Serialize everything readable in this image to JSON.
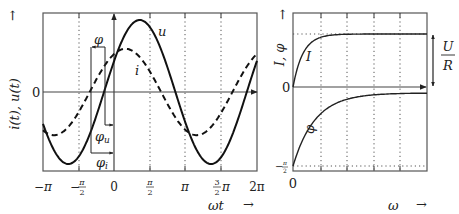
{
  "left_panel": {
    "y_label": "i(t), u(t)",
    "y_arrow": "↑",
    "zero_label": "0",
    "x_label": "ωt",
    "x_arrow": "→",
    "x_ticks": [
      "−π",
      "−π/2",
      "0",
      "π/2",
      "π",
      "3/2π",
      "2π"
    ],
    "curve_labels": {
      "u": "u",
      "i": "i"
    },
    "phase_labels": {
      "phi": "φ",
      "phi_u": "φu",
      "phi_i": "φi"
    }
  },
  "right_panel": {
    "y_label": "I, φ",
    "y_arrow": "↑",
    "zero_label": "0",
    "neg_label": "−π/2",
    "x_zero_label": "0",
    "x_label": "ω",
    "x_arrow": "→",
    "curve_labels": {
      "I": "I",
      "phi": "φ"
    },
    "asymptote_label": {
      "num": "U",
      "den": "R"
    }
  },
  "chart_data": [
    {
      "type": "line",
      "title": "",
      "xlabel": "ωt",
      "ylabel": "i(t), u(t)",
      "xlim": [
        "−π",
        "2π"
      ],
      "x_ticks": [
        "−π",
        "−π/2",
        "0",
        "π/2",
        "π",
        "3/2π",
        "2π"
      ],
      "grid": "dotted verticals at ±π/2 multiples",
      "series": [
        {
          "name": "u",
          "style": "solid",
          "amplitude": 1.0,
          "phase_offset_rad": 0.44,
          "function": "û·sin(ωt + φu)"
        },
        {
          "name": "i",
          "style": "dashed",
          "amplitude": 0.6,
          "phase_offset_rad": 1.07,
          "function": "î·sin(ωt + φi)"
        }
      ],
      "annotations": [
        "φ = φi − φu",
        "φu",
        "φi"
      ]
    },
    {
      "type": "line",
      "title": "",
      "xlabel": "ω",
      "ylabel": "I, φ",
      "series": [
        {
          "name": "I",
          "style": "solid",
          "description": "rises from 0 to asymptote U/R"
        },
        {
          "name": "φ",
          "style": "solid",
          "description": "rises from −π/2 toward 0"
        }
      ],
      "y_ticks": [
        "0",
        "−π/2"
      ],
      "annotations": [
        "U/R"
      ]
    }
  ]
}
